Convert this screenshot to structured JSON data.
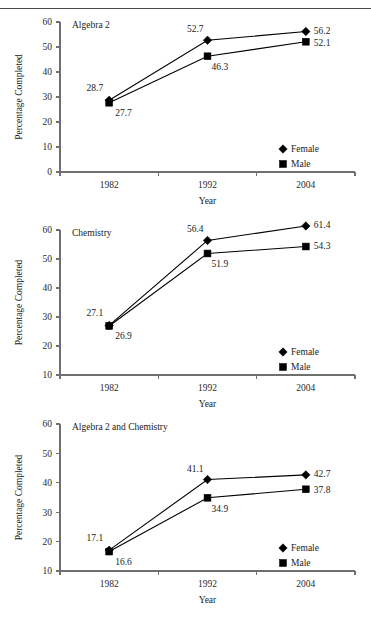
{
  "page": {
    "header_rule": true,
    "header_faint_text": "",
    "y_axis_title": "Percentage Completed",
    "x_axis_title": "Year",
    "legend": {
      "female_label": "Female",
      "male_label": "Male",
      "female_marker": "diamond-marker-icon",
      "male_marker": "square-marker-icon"
    },
    "colors": {
      "line": "#000000",
      "marker": "#000000",
      "axis": "#6f6f6f",
      "text": "#1a1a1a",
      "background": "#ffffff"
    }
  },
  "chart_data": [
    {
      "type": "line",
      "title": "Algebra 2",
      "xlabel": "Year",
      "ylabel": "Percentage Completed",
      "categories": [
        "1982",
        "1992",
        "2004"
      ],
      "x": [
        1982,
        1992,
        2004
      ],
      "ylim": [
        0,
        60
      ],
      "yticks": [
        0,
        10,
        20,
        30,
        40,
        50,
        60
      ],
      "grid": false,
      "legend_position": "bottom-right",
      "series": [
        {
          "name": "Female",
          "marker": "diamond",
          "values": [
            28.7,
            52.7,
            56.2
          ],
          "labels": [
            "28.7",
            "52.7",
            "56.2"
          ]
        },
        {
          "name": "Male",
          "marker": "square",
          "values": [
            27.7,
            46.3,
            52.1
          ],
          "labels": [
            "27.7",
            "46.3",
            "52.1"
          ]
        }
      ]
    },
    {
      "type": "line",
      "title": "Chemistry",
      "xlabel": "Year",
      "ylabel": "Percentage Completed",
      "categories": [
        "1982",
        "1992",
        "2004"
      ],
      "x": [
        1982,
        1992,
        2004
      ],
      "ylim": [
        10,
        60
      ],
      "yticks": [
        10,
        20,
        30,
        40,
        50,
        60
      ],
      "grid": false,
      "legend_position": "bottom-right",
      "series": [
        {
          "name": "Female",
          "marker": "diamond",
          "values": [
            27.1,
            56.4,
            61.4
          ],
          "labels": [
            "27.1",
            "56.4",
            "61.4"
          ]
        },
        {
          "name": "Male",
          "marker": "square",
          "values": [
            26.9,
            51.9,
            54.3
          ],
          "labels": [
            "26.9",
            "51.9",
            "54.3"
          ]
        }
      ]
    },
    {
      "type": "line",
      "title": "Algebra 2 and Chemistry",
      "xlabel": "Year",
      "ylabel": "Percentage Completed",
      "categories": [
        "1982",
        "1992",
        "2004"
      ],
      "x": [
        1982,
        1992,
        2004
      ],
      "ylim": [
        10,
        60
      ],
      "yticks": [
        10,
        20,
        30,
        40,
        50,
        60
      ],
      "grid": false,
      "legend_position": "bottom-right",
      "series": [
        {
          "name": "Female",
          "marker": "diamond",
          "values": [
            17.1,
            41.1,
            42.7
          ],
          "labels": [
            "17.1",
            "41.1",
            "42.7"
          ]
        },
        {
          "name": "Male",
          "marker": "square",
          "values": [
            16.6,
            34.9,
            37.8
          ],
          "labels": [
            "16.6",
            "34.9",
            "37.8"
          ]
        }
      ]
    }
  ]
}
